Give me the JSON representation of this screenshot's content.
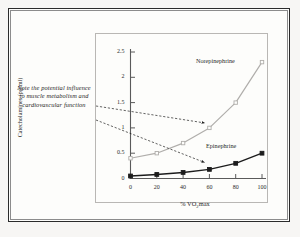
{
  "figure": {
    "annotation_note": "Note the potential influence to muscle metabolism and cardiovascular function",
    "frame_color": "#2b2b2b",
    "page_color": "#fdfdfb",
    "plot_border_color": "#b9b7b4"
  },
  "chart_data": {
    "type": "line",
    "title": "",
    "xlabel": "% VO2max",
    "xlabel_main": "% VO",
    "xlabel_sub": "2",
    "xlabel_tail": "max",
    "ylabel": "Catecholamines (pg/ml)",
    "x": [
      0,
      20,
      40,
      60,
      80,
      100
    ],
    "xticks": [
      "0",
      "20",
      "40",
      "60",
      "80",
      "100"
    ],
    "yticks": [
      "0",
      "0.5",
      "1",
      "1.5",
      "2",
      "2.5"
    ],
    "ytick_values": [
      0,
      0.5,
      1,
      1.5,
      2,
      2.5
    ],
    "xlim": [
      0,
      100
    ],
    "ylim": [
      0,
      2.5
    ],
    "grid": false,
    "legend_position": "inline-labels",
    "series": [
      {
        "name": "Norepinephrine",
        "values": [
          0.4,
          0.5,
          0.7,
          1.0,
          1.5,
          2.3
        ],
        "color": "#b0aeab",
        "marker": "square-open"
      },
      {
        "name": "Epinephrine",
        "values": [
          0.05,
          0.08,
          0.12,
          0.18,
          0.3,
          0.5
        ],
        "color": "#1c1c1c",
        "marker": "square-filled"
      }
    ],
    "annotations": [
      {
        "text": "Note the potential influence to muscle metabolism and cardiovascular function",
        "arrow_to_series": "Norepinephrine",
        "arrow_target_x": 60,
        "arrow_target_y": 1.0
      },
      {
        "text": "Note the potential influence to muscle metabolism and cardiovascular function",
        "arrow_to_series": "Epinephrine",
        "arrow_target_x": 60,
        "arrow_target_y": 0.18
      }
    ]
  }
}
